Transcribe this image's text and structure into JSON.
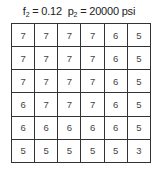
{
  "title": {
    "f_label": "f",
    "f_sub": "2",
    "f_value": " = 0.12  ",
    "p_label": "p",
    "p_sub": "2",
    "p_value": " = 20000 psi"
  },
  "grid": [
    [
      "7",
      "7",
      "7",
      "7",
      "6",
      "5"
    ],
    [
      "7",
      "7",
      "7",
      "7",
      "6",
      "5"
    ],
    [
      "7",
      "7",
      "7",
      "7",
      "6",
      "5"
    ],
    [
      "6",
      "7",
      "7",
      "7",
      "6",
      "5"
    ],
    [
      "6",
      "6",
      "6",
      "6",
      "6",
      "5"
    ],
    [
      "5",
      "5",
      "5",
      "5",
      "5",
      "3"
    ]
  ]
}
